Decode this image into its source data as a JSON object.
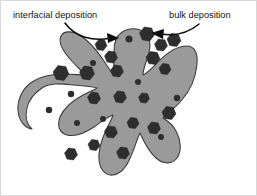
{
  "figure": {
    "background_color": "#ffffff",
    "border_color": "#d8d8d8",
    "width": 257,
    "height": 196
  },
  "labels": {
    "left": {
      "text": "interfacial deposition",
      "x": 12,
      "y": 17
    },
    "right": {
      "text": "bulk deposition",
      "x": 168,
      "y": 17
    }
  },
  "arrows": {
    "left": {
      "name": "interfacial-deposition-arrow",
      "path": "M 64 22 C 74 36, 92 41, 110 37",
      "head_points": "118,37 106,32 107,42"
    },
    "right": {
      "name": "bulk-deposition-arrow",
      "path": "M 198 23 C 186 33, 172 35, 160 33",
      "head_points": "150,32 163,28 162,38"
    }
  },
  "particle": {
    "name": "dendritic-particle",
    "fill_color": "#9a9a9a",
    "stroke_color": "#3a3a3a",
    "outline_path": "M 120 32 C 126 27, 136 26, 143 31 C 150 36, 150 46, 147 55 C 145 62, 142 68, 142 74 C 147 72, 152 66, 158 60 C 166 52, 176 45, 186 45 C 194 45, 197 53, 196 63 C 195 76, 189 90, 180 100 C 174 107, 167 112, 162 117 C 167 120, 172 124, 175 130 C 180 139, 181 150, 176 157 C 171 164, 162 163, 155 157 C 148 151, 143 141, 139 132 C 136 138, 134 146, 130 155 C 126 165, 120 173, 112 174 C 104 175, 99 168, 98 159 C 97 149, 101 138, 105 129 C 108 123, 111 118, 112 114 C 106 116, 100 121, 93 126 C 84 132, 74 136, 66 134 C 58 132, 56 124, 59 116 C 63 106, 73 99, 82 94 C 88 91, 93 89, 96 87 C 90 85, 82 85, 73 84 C 62 83, 49 81, 41 87 C 35 91, 28 98, 26 107 C 24 116, 26 124, 31 128 C 24 127, 18 120, 17 110 C 16 98, 22 87, 31 81 C 40 75, 52 73, 63 73 C 72 73, 79 74, 84 74 C 80 69, 74 64, 69 58 C 62 50, 57 41, 60 35 C 63 29, 72 30, 80 35 C 89 41, 97 51, 103 60 C 107 66, 110 71, 112 74 C 113 68, 113 60, 113 51 C 113 43, 114 36, 120 32 Z",
    "deposits": [
      {
        "type": "hex",
        "x": 146,
        "y": 33,
        "r": 7.5,
        "name": "deposit-hex-top-right"
      },
      {
        "type": "hex",
        "x": 160,
        "y": 44,
        "r": 6.5,
        "name": "deposit-hex-upper-right-1"
      },
      {
        "type": "hex",
        "x": 173,
        "y": 39,
        "r": 7.0,
        "name": "deposit-hex-upper-right-2"
      },
      {
        "type": "hex",
        "x": 152,
        "y": 57,
        "r": 7.0,
        "name": "deposit-hex-right-inner"
      },
      {
        "type": "hex",
        "x": 164,
        "y": 68,
        "r": 6.0,
        "name": "deposit-hex-right-mid"
      },
      {
        "type": "hex",
        "x": 100,
        "y": 44,
        "r": 6.0,
        "name": "deposit-hex-upper-left-1"
      },
      {
        "type": "hex",
        "x": 110,
        "y": 56,
        "r": 6.5,
        "name": "deposit-hex-upper-left-2"
      },
      {
        "type": "hex",
        "x": 116,
        "y": 70,
        "r": 6.5,
        "name": "deposit-hex-center-upper"
      },
      {
        "type": "hex",
        "x": 86,
        "y": 72,
        "r": 7.5,
        "name": "deposit-hex-left-upper"
      },
      {
        "type": "hex",
        "x": 60,
        "y": 72,
        "r": 8.0,
        "name": "deposit-hex-left-outer"
      },
      {
        "type": "hex",
        "x": 93,
        "y": 97,
        "r": 6.5,
        "name": "deposit-hex-left-mid"
      },
      {
        "type": "hex",
        "x": 119,
        "y": 96,
        "r": 6.5,
        "name": "deposit-hex-center"
      },
      {
        "type": "hex",
        "x": 143,
        "y": 97,
        "r": 5.5,
        "name": "deposit-hex-center-right"
      },
      {
        "type": "hex",
        "x": 168,
        "y": 112,
        "r": 7.0,
        "name": "deposit-hex-lower-right"
      },
      {
        "type": "hex",
        "x": 153,
        "y": 127,
        "r": 6.5,
        "name": "deposit-hex-bottom-right"
      },
      {
        "type": "hex",
        "x": 132,
        "y": 122,
        "r": 6.0,
        "name": "deposit-hex-bottom-center-1"
      },
      {
        "type": "hex",
        "x": 110,
        "y": 131,
        "r": 6.5,
        "name": "deposit-hex-bottom-center-2"
      },
      {
        "type": "hex",
        "x": 93,
        "y": 144,
        "r": 6.0,
        "name": "deposit-hex-bottom-left-1"
      },
      {
        "type": "hex",
        "x": 70,
        "y": 153,
        "r": 6.5,
        "name": "deposit-hex-bottom-left-2"
      },
      {
        "type": "hex",
        "x": 122,
        "y": 152,
        "r": 6.5,
        "name": "deposit-hex-bottom-mid"
      },
      {
        "type": "dot",
        "x": 128,
        "y": 38,
        "r": 3.5,
        "name": "deposit-dot-top"
      },
      {
        "type": "dot",
        "x": 92,
        "y": 62,
        "r": 3.0,
        "name": "deposit-dot-left-upper"
      },
      {
        "type": "dot",
        "x": 70,
        "y": 93,
        "r": 3.2,
        "name": "deposit-dot-left"
      },
      {
        "type": "dot",
        "x": 48,
        "y": 109,
        "r": 3.2,
        "name": "deposit-dot-left-lower"
      },
      {
        "type": "dot",
        "x": 76,
        "y": 122,
        "r": 3.0,
        "name": "deposit-dot-lower-left"
      },
      {
        "type": "dot",
        "x": 102,
        "y": 118,
        "r": 3.0,
        "name": "deposit-dot-lower-center"
      },
      {
        "type": "dot",
        "x": 137,
        "y": 81,
        "r": 3.0,
        "name": "deposit-dot-center-right"
      },
      {
        "type": "dot",
        "x": 176,
        "y": 97,
        "r": 3.2,
        "name": "deposit-dot-right"
      },
      {
        "type": "dot",
        "x": 160,
        "y": 136,
        "r": 3.0,
        "name": "deposit-dot-bottom-right"
      }
    ]
  }
}
